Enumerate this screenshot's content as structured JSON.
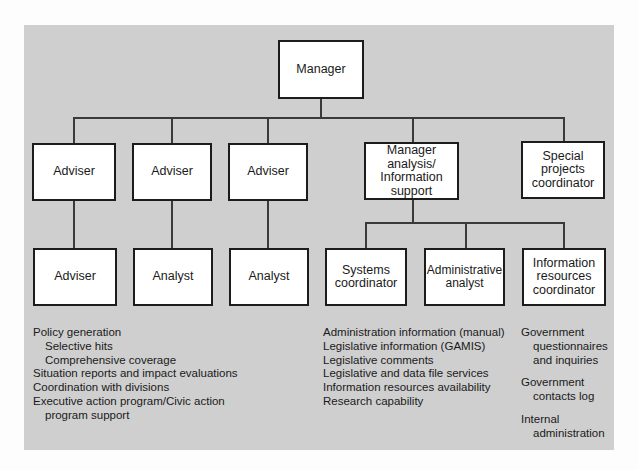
{
  "org_chart": {
    "top": {
      "label": "Manager"
    },
    "level1": [
      {
        "label": "Adviser"
      },
      {
        "label": "Adviser"
      },
      {
        "label": "Adviser"
      },
      {
        "label": "Manager\nanalysis/\nInformation\nsupport"
      },
      {
        "label": "Special\nprojects\ncoordinator"
      }
    ],
    "level2": [
      {
        "label": "Adviser"
      },
      {
        "label": "Analyst"
      },
      {
        "label": "Analyst"
      },
      {
        "label": "Systems\ncoordinator"
      },
      {
        "label": "Administrative\nanalyst"
      },
      {
        "label": "Information\nresources\ncoordinator"
      }
    ]
  },
  "notes": {
    "left": [
      {
        "text": "Policy generation",
        "indent": false
      },
      {
        "text": "Selective hits",
        "indent": true
      },
      {
        "text": "Comprehensive coverage",
        "indent": true
      },
      {
        "text": "Situation reports and impact evaluations",
        "indent": false
      },
      {
        "text": "Coordination with divisions",
        "indent": false
      },
      {
        "text": "Executive action program/Civic action",
        "indent": false
      },
      {
        "text": "program support",
        "indent": true
      }
    ],
    "middle": [
      "Administration information (manual)",
      "Legislative information (GAMIS)",
      "Legislative comments",
      "Legislative and data file services",
      "Information resources availability",
      "Research capability"
    ],
    "right": [
      {
        "lines": [
          "Government",
          "questionnaires",
          "and inquiries"
        ]
      },
      {
        "lines": [
          "Government",
          "contacts log"
        ]
      },
      {
        "lines": [
          "Internal",
          "administration"
        ]
      }
    ]
  },
  "colors": {
    "panel": "#cfcfcf",
    "box": "#ffffff",
    "line": "#3a3a3a"
  }
}
